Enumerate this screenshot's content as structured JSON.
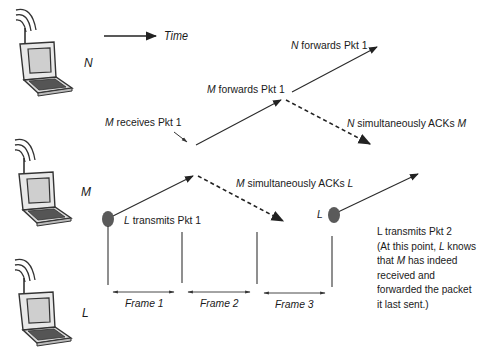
{
  "legend": {
    "time_label": "Time"
  },
  "nodes": [
    {
      "id": "N",
      "label": "N",
      "icon": "wireless-laptop-icon"
    },
    {
      "id": "M",
      "label": "M",
      "icon": "wireless-laptop-icon"
    },
    {
      "id": "L",
      "label": "L",
      "icon": "wireless-laptop-icon"
    }
  ],
  "events": {
    "n_forwards": {
      "subject": "N",
      "text": " forwards Pkt 1"
    },
    "m_forwards": {
      "subject": "M",
      "text": " forwards Pkt 1"
    },
    "m_receives": {
      "subject": "M",
      "text": " receives Pkt 1"
    },
    "n_acks": {
      "subject": "N",
      "text": " simultaneously ACKs ",
      "object": "M"
    },
    "m_acks": {
      "subject": "M",
      "text": " simultaneously ACKs ",
      "object": "L"
    },
    "l_transmits_1": {
      "subject": "L",
      "text": " transmits Pkt 1"
    },
    "l_marker_2": "L"
  },
  "frames": [
    "Frame 1",
    "Frame 2",
    "Frame 3"
  ],
  "note": {
    "line1": "L transmits Pkt 2",
    "line2_a": "(At this point, ",
    "line2_b": "L",
    "line2_c": " knows",
    "line3_a": "that ",
    "line3_b": "M",
    "line3_c": " has indeed",
    "line4": "received and",
    "line5": "forwarded the packet",
    "line6": "it last sent.)"
  },
  "colors": {
    "line": "#2a2a2a",
    "dot": "#555555",
    "text": "#1a1a1a"
  }
}
